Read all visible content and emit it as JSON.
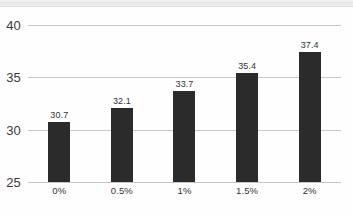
{
  "chart_data": {
    "type": "bar",
    "title": "",
    "subtitle": "",
    "xlabel": "",
    "ylabel": "",
    "categories": [
      "0%",
      "0.5%",
      "1%",
      "1.5%",
      "2%"
    ],
    "values": [
      30.7,
      32.1,
      33.7,
      35.4,
      37.4
    ],
    "value_labels": [
      "30.7",
      "32.1",
      "33.7",
      "35.4",
      "37.4"
    ],
    "ylim": [
      25,
      40
    ],
    "yticks": [
      25,
      30,
      35,
      40
    ],
    "ytick_labels": [
      "25",
      "30",
      "35",
      "40"
    ],
    "grid": true,
    "grid_axis": "y",
    "legend": false,
    "legend_position": "none",
    "bar_color": "#2b2b2b",
    "gridline_color": "#c9c9ca",
    "background_color": "#fefefe",
    "text_color": "#343434"
  }
}
